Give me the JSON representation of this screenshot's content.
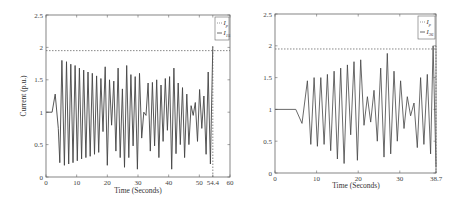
{
  "chart_data": [
    {
      "type": "line",
      "title": "",
      "xlabel": "Time (Seconds)",
      "ylabel": "Current (p.u.)",
      "xlim": [
        0,
        60
      ],
      "ylim": [
        0,
        2.5
      ],
      "xticks": [
        "0",
        "10",
        "20",
        "30",
        "40",
        "50",
        "54.4",
        "60"
      ],
      "yticks": [
        "0",
        "0.5",
        "1",
        "1.5",
        "2",
        "2.5"
      ],
      "grid": false,
      "legend_position": "upper right",
      "legend": [
        {
          "label": "I",
          "sub": "p",
          "style": "dashed"
        },
        {
          "label": "I",
          "sub": "15",
          "style": "solid"
        }
      ],
      "annotations": [
        {
          "type": "hline",
          "y": 1.95,
          "style": "dashed",
          "label": "pickup current I_p"
        },
        {
          "type": "vline",
          "x": 54.4,
          "style": "dashed",
          "label": "trip time 54.4 s"
        }
      ],
      "series": [
        {
          "name": "I_15",
          "description": "Pre-disturbance 1.0 p.u., small bump to ~1.28 at t≈3 s, then growing/sustained power swing oscillations (~1.1 s period) between ~0.2 and ~1.8 p.u., irregular envelope 20–54 s; crosses 2.0 p.u. at t=54.4 s",
          "x": [
            0,
            2,
            3,
            4,
            4.5,
            5.2,
            6.0,
            6.7,
            7.4,
            8.1,
            8.8,
            9.5,
            10.2,
            10.9,
            11.6,
            12.3,
            13.0,
            13.7,
            14.4,
            15.1,
            15.8,
            16.5,
            17.2,
            17.9,
            18.6,
            19.3,
            20.0,
            20.7,
            21.4,
            22.1,
            22.8,
            23.5,
            24.2,
            24.9,
            25.6,
            26.3,
            27.0,
            27.7,
            28.4,
            29.1,
            29.8,
            30.5,
            31.2,
            31.9,
            32.6,
            33.3,
            34.0,
            34.7,
            35.4,
            36.1,
            36.8,
            37.5,
            38.2,
            38.9,
            39.6,
            40.3,
            41.0,
            41.7,
            42.4,
            43.1,
            43.8,
            44.5,
            45.2,
            45.9,
            46.6,
            47.3,
            48.0,
            48.7,
            49.4,
            50.1,
            50.8,
            51.5,
            52.2,
            52.9,
            53.6,
            54.4
          ],
          "y": [
            1.0,
            1.0,
            1.28,
            0.75,
            0.22,
            1.8,
            0.18,
            1.78,
            0.2,
            1.74,
            0.22,
            1.72,
            0.25,
            1.68,
            0.28,
            1.65,
            0.3,
            1.62,
            0.32,
            1.6,
            0.35,
            1.56,
            0.38,
            1.52,
            0.7,
            1.7,
            0.18,
            1.5,
            0.8,
            1.48,
            0.4,
            1.68,
            0.3,
            1.36,
            0.15,
            1.72,
            0.3,
            1.58,
            0.48,
            1.55,
            0.12,
            1.6,
            0.6,
            1.0,
            0.95,
            1.45,
            0.4,
            1.46,
            0.48,
            1.5,
            0.3,
            1.42,
            0.55,
            1.52,
            0.72,
            1.55,
            0.12,
            1.68,
            0.36,
            1.45,
            0.5,
            1.38,
            0.3,
            1.28,
            0.5,
            1.1,
            0.95,
            1.15,
            0.55,
            1.35,
            0.75,
            1.25,
            0.35,
            1.62,
            0.2,
            2.02
          ]
        },
        {
          "name": "I_p",
          "x": [
            0,
            60
          ],
          "y": [
            1.95,
            1.95
          ]
        }
      ]
    },
    {
      "type": "line",
      "title": "",
      "xlabel": "Time (Seconds)",
      "ylabel": "",
      "xlim": [
        0,
        38.7
      ],
      "ylim": [
        0,
        2.5
      ],
      "xticks": [
        "0",
        "10",
        "20",
        "30",
        "38.7"
      ],
      "yticks": [
        "0",
        "0.5",
        "1",
        "1.5",
        "2",
        "2.5"
      ],
      "grid": false,
      "legend_position": "upper right",
      "legend": [
        {
          "label": "I",
          "sub": "p",
          "style": "dashed"
        },
        {
          "label": "I",
          "sub": "36",
          "style": "solid"
        }
      ],
      "annotations": [
        {
          "type": "hline",
          "y": 1.95,
          "style": "dashed",
          "label": "pickup current I_p"
        },
        {
          "type": "vline",
          "x": 38.7,
          "style": "dashed",
          "label": "trip time 38.7 s"
        }
      ],
      "series": [
        {
          "name": "I_36",
          "description": "Flat 1.0 p.u. until ~5 s, dip to ~0.78 at ~6.5 s, then oscillations (~1.2 s period) between ~0.15 and ~1.9 p.u.; exceeds 2.0 at t=38.7 s",
          "x": [
            0,
            5,
            6.5,
            7.8,
            8.6,
            9.4,
            10.2,
            11.0,
            11.8,
            12.6,
            13.4,
            14.2,
            15.0,
            15.8,
            16.6,
            17.4,
            18.2,
            19.0,
            19.8,
            20.6,
            21.4,
            22.2,
            23.0,
            23.8,
            24.6,
            25.4,
            26.2,
            27.0,
            27.8,
            28.6,
            29.4,
            30.2,
            31.0,
            31.8,
            32.6,
            33.4,
            34.2,
            35.0,
            35.8,
            36.6,
            37.4,
            38.0,
            38.7
          ],
          "y": [
            1.0,
            1.0,
            0.78,
            1.45,
            0.45,
            1.5,
            0.42,
            1.5,
            0.45,
            1.55,
            0.35,
            1.6,
            0.22,
            1.65,
            0.15,
            1.7,
            0.6,
            1.75,
            0.2,
            1.78,
            0.75,
            1.2,
            0.8,
            1.3,
            0.5,
            1.65,
            0.25,
            1.88,
            0.3,
            1.6,
            0.5,
            1.45,
            0.7,
            1.2,
            0.9,
            1.1,
            0.4,
            1.5,
            0.45,
            1.55,
            0.3,
            2.0,
            0.1
          ]
        },
        {
          "name": "I_p",
          "x": [
            0,
            38.7
          ],
          "y": [
            1.95,
            1.95
          ]
        }
      ]
    }
  ],
  "charts": {
    "left": {
      "ylabel": "Current (p.u.)",
      "xlabel": "Time (Seconds)",
      "legend_ip": "I",
      "legend_ip_sub": "p",
      "legend_is": "I",
      "legend_is_sub": "15"
    },
    "right": {
      "xlabel": "Time (Seconds)",
      "legend_ip": "I",
      "legend_ip_sub": "p",
      "legend_is": "I",
      "legend_is_sub": "36"
    }
  }
}
